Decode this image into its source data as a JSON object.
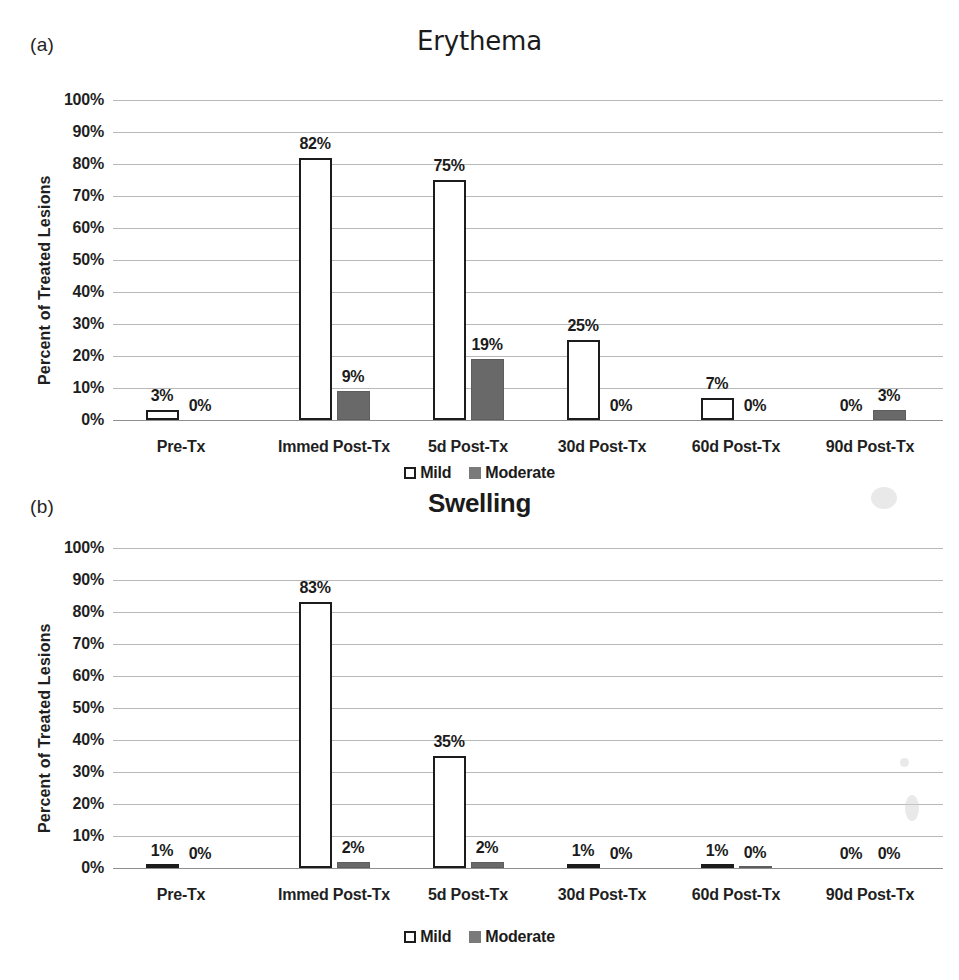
{
  "figure": {
    "panels": [
      {
        "letter": "(a)",
        "title": "Erythema"
      },
      {
        "letter": "(b)",
        "title": "Swelling"
      }
    ],
    "legend": [
      {
        "label": "Mild",
        "swatch": "mild-swatch"
      },
      {
        "label": "Moderate",
        "swatch": "moderate-swatch"
      }
    ]
  },
  "chart_data": [
    {
      "type": "bar",
      "title": "Erythema",
      "panel": "(a)",
      "xlabel": "",
      "ylabel": "Percent of Treated Lesions",
      "ylim": [
        0,
        100
      ],
      "yticks": [
        "0%",
        "10%",
        "20%",
        "30%",
        "40%",
        "50%",
        "60%",
        "70%",
        "80%",
        "90%",
        "100%"
      ],
      "ytick_values": [
        0,
        10,
        20,
        30,
        40,
        50,
        60,
        70,
        80,
        90,
        100
      ],
      "grid": true,
      "legend_position": "bottom",
      "categories": [
        "Pre-Tx",
        "Immed Post-Tx",
        "5d Post-Tx",
        "30d Post-Tx",
        "60d Post-Tx",
        "90d Post-Tx"
      ],
      "series": [
        {
          "name": "Mild",
          "values": [
            3,
            82,
            75,
            25,
            7,
            0
          ],
          "labels": [
            "3%",
            "82%",
            "75%",
            "25%",
            "7%",
            "0%"
          ],
          "color": "#ffffff",
          "edge": "#1c1c1c"
        },
        {
          "name": "Moderate",
          "values": [
            0,
            9,
            19,
            0,
            0,
            3
          ],
          "labels": [
            "0%",
            "9%",
            "19%",
            "0%",
            "0%",
            "3%"
          ],
          "color": "#696969",
          "edge": "#5e5e5e"
        }
      ]
    },
    {
      "type": "bar",
      "title": "Swelling",
      "panel": "(b)",
      "xlabel": "",
      "ylabel": "Percent of Treated Lesions",
      "ylim": [
        0,
        100
      ],
      "yticks": [
        "0%",
        "10%",
        "20%",
        "30%",
        "40%",
        "50%",
        "60%",
        "70%",
        "80%",
        "90%",
        "100%"
      ],
      "ytick_values": [
        0,
        10,
        20,
        30,
        40,
        50,
        60,
        70,
        80,
        90,
        100
      ],
      "grid": true,
      "legend_position": "bottom",
      "categories": [
        "Pre-Tx",
        "Immed Post-Tx",
        "5d Post-Tx",
        "30d Post-Tx",
        "60d Post-Tx",
        "90d Post-Tx"
      ],
      "series": [
        {
          "name": "Mild",
          "values": [
            1,
            83,
            35,
            1,
            1,
            0
          ],
          "labels": [
            "1%",
            "83%",
            "35%",
            "1%",
            "1%",
            "0%"
          ],
          "color": "#ffffff",
          "edge": "#1c1c1c"
        },
        {
          "name": "Moderate",
          "values": [
            0,
            2,
            2,
            0,
            0.4,
            0
          ],
          "labels": [
            "0%",
            "2%",
            "2%",
            "0%",
            "0%",
            "0%"
          ],
          "color": "#696969",
          "edge": "#5e5e5e"
        }
      ]
    }
  ],
  "layout": {
    "plot_left": 113,
    "plot_width": 830,
    "group_centers": [
      181,
      334,
      468,
      602,
      736,
      870
    ],
    "bar_width": 33,
    "bar_gap": 5,
    "panels": [
      {
        "plot_top": 100,
        "plot_height": 320,
        "cat_label_y": 438,
        "legend_y": 464,
        "axis_title_x": 36,
        "axis_title_y": 385
      },
      {
        "plot_top": 60,
        "plot_height": 320,
        "cat_label_y": 398,
        "legend_y": 440,
        "axis_title_x": 36,
        "axis_title_y": 345
      }
    ]
  }
}
